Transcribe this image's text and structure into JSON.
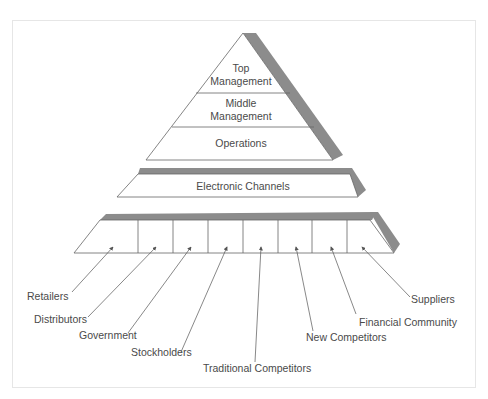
{
  "diagram": {
    "type": "layered-pyramid",
    "colors": {
      "line": "#555555",
      "shadow": "#8c8c8c",
      "fill": "#ffffff",
      "text": "#4a4a4a",
      "frame": "#e6e6e6"
    },
    "pyramid": {
      "levels": [
        {
          "line1": "Top",
          "line2": "Management"
        },
        {
          "line1": "Middle",
          "line2": "Management"
        },
        {
          "line1": "Operations"
        }
      ]
    },
    "middle_shelf": {
      "label": "Electronic Channels"
    },
    "bottom_shelf": {
      "cells": 8,
      "stakeholders": [
        "Retailers",
        "Distributors",
        "Government",
        "Stockholders",
        "Traditional Competitors",
        "New Competitors",
        "Financial Community",
        "Suppliers"
      ]
    }
  }
}
